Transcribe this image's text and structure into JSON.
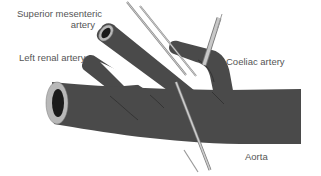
{
  "figure": {
    "labels": {
      "superior_mesenteric_line1": "Superior mesenteric",
      "superior_mesenteric_line2": "artery",
      "left_renal": "Left renal artery",
      "coeliac": "Coeliac artery",
      "aorta": "Aorta"
    },
    "colors": {
      "vessel": "#4a4a4a",
      "vessel_dark": "#2e2e2e",
      "lumen_rim": "#b8b8b8",
      "lumen": "#1a1a1a",
      "needle": "#bdbdbd",
      "needle_edge": "#7a7a7a",
      "label": "#555555",
      "background": "#ffffff"
    }
  }
}
